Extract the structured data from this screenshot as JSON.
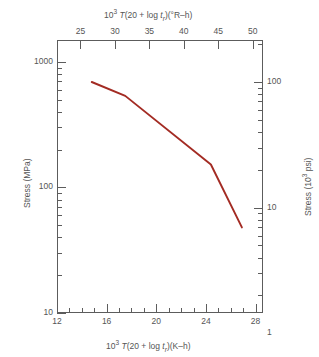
{
  "chart_data": {
    "type": "line",
    "title": "",
    "xlabel_bottom": "10³ T(20 + log t_r)(K–h)",
    "xlabel_top": "10³ T(20 + log t_r)(°R–h)",
    "ylabel_left": "Stress (MPa)",
    "ylabel_right": "Stress (10³ psi)",
    "x_bottom_ticks": [
      "12",
      "16",
      "20",
      "24",
      "28"
    ],
    "x_bottom_tick_values": [
      12,
      16,
      20,
      24,
      28
    ],
    "x_bottom_minor_values": [
      13,
      14,
      15,
      17,
      18,
      19,
      21,
      22,
      23,
      25,
      26,
      27,
      28
    ],
    "xlim_bottom": [
      12,
      28.6
    ],
    "x_top_ticks": [
      "25",
      "30",
      "35",
      "40",
      "45",
      "50"
    ],
    "x_top_tick_values": [
      25,
      30,
      35,
      40,
      45,
      50
    ],
    "xlim_top": [
      21.6,
      51.48
    ],
    "y_left_ticks": [
      "10",
      "100",
      "1000"
    ],
    "y_left_tick_values": [
      10,
      100,
      1000
    ],
    "ylim_left": [
      10,
      1490
    ],
    "y_right_ticks": [
      "1",
      "10",
      "100"
    ],
    "y_right_tick_values": [
      1,
      10,
      100
    ],
    "ylim_right": [
      1.45,
      216
    ],
    "yscale": "log",
    "grid": false,
    "legend": "none",
    "series": [
      {
        "name": "stress-rupture-curve",
        "color": "#a32b23",
        "points": [
          {
            "x": 14.8,
            "y": 690
          },
          {
            "x": 17.5,
            "y": 535
          },
          {
            "x": 24.4,
            "y": 152
          },
          {
            "x": 26.9,
            "y": 48
          }
        ]
      }
    ]
  },
  "axes": {
    "left_title": "Stress (MPa)",
    "right_title_pre": "Stress (10",
    "right_title_sup": "3",
    "right_title_post": " psi)",
    "top_title_pre": "10",
    "top_title_sup": "3",
    "top_title_t": "T",
    "top_title_mid": "(20 + log ",
    "top_title_tr": "t",
    "top_title_trsub": "r",
    "top_title_end": ")(°R–h)",
    "bottom_title_pre": "10",
    "bottom_title_sup": "3",
    "bottom_title_t": "T",
    "bottom_title_mid": "(20 + log ",
    "bottom_title_tr": "t",
    "bottom_title_trsub": "r",
    "bottom_title_end": ")(K–h)"
  }
}
